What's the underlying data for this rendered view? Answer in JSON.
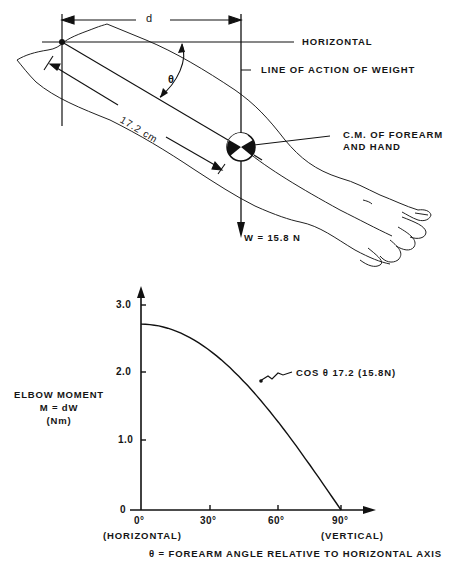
{
  "diagram": {
    "labels": {
      "d": "d",
      "horizontal": "HORIZONTAL",
      "line_of_action": "LINE OF ACTION OF WEIGHT",
      "theta": "θ",
      "length": "17.2 cm",
      "cm_line1": "C.M. OF FOREARM",
      "cm_line2": "AND HAND",
      "weight": "W = 15.8 N"
    }
  },
  "chart_data": {
    "type": "line",
    "title": "",
    "xlabel": "θ = FOREARM ANGLE RELATIVE TO HORIZONTAL AXIS",
    "ylabel": [
      "ELBOW MOMENT",
      "M = dW",
      "(Nm)"
    ],
    "x_ticks": [
      "0°",
      "30°",
      "60°",
      "90°"
    ],
    "x_tick_sublabels": {
      "0": "(HORIZONTAL)",
      "90": "(VERTICAL)"
    },
    "y_ticks": [
      "0",
      "1.0",
      "2.0",
      "3.0"
    ],
    "xlim": [
      0,
      90
    ],
    "ylim": [
      0,
      3.0
    ],
    "grid": false,
    "series": [
      {
        "name": "COS θ 17.2 (15.8N)",
        "x": [
          0,
          10,
          20,
          30,
          40,
          50,
          60,
          70,
          80,
          90
        ],
        "values": [
          2.72,
          2.68,
          2.55,
          2.35,
          2.08,
          1.75,
          1.36,
          0.93,
          0.47,
          0.0
        ]
      }
    ],
    "annotation": "COS θ 17.2 (15.8N)"
  }
}
